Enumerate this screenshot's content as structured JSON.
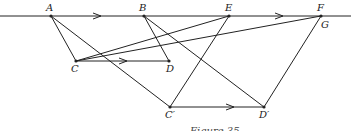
{
  "figure": {
    "caption": "Figure 35",
    "points": {
      "A": {
        "label": "A",
        "x": 51,
        "y": 16
      },
      "B": {
        "label": "B",
        "x": 144,
        "y": 16
      },
      "E": {
        "label": "E",
        "x": 229,
        "y": 16
      },
      "F": {
        "label": "F",
        "x": 321,
        "y": 16
      },
      "G": {
        "label": "G"
      },
      "C": {
        "label": "C",
        "x": 76,
        "y": 61
      },
      "D": {
        "label": "D",
        "x": 169,
        "y": 61
      },
      "C2": {
        "label": "C′",
        "x": 170,
        "y": 107
      },
      "D2": {
        "label": "D′",
        "x": 264,
        "y": 107
      }
    },
    "segments": [
      "A-C",
      "A-C′",
      "B-D",
      "B-D′",
      "C-E",
      "C-F",
      "C-D",
      "C′-D′",
      "C′-E",
      "D′-G"
    ],
    "colors": {
      "stroke": "#222222",
      "background": "#ffffff"
    }
  }
}
